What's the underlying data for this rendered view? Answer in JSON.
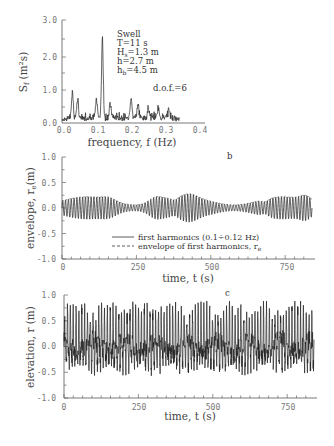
{
  "chart_data": [
    {
      "panel": "a",
      "type": "line",
      "title": "",
      "xlabel": "frequency, f (Hz)",
      "ylabel": "S_f (m^2 s)",
      "xlim": [
        0.0,
        0.4
      ],
      "ylim": [
        0.0,
        3.0
      ],
      "xticks": [
        "0.0",
        "0.1",
        "0.2",
        "0.3",
        "0.4"
      ],
      "yticks": [
        "0.0",
        "1.0",
        "2.0",
        "3.0"
      ],
      "grid": false,
      "annotation_lines": [
        "Swell",
        "T=11 s",
        "Hs=1.3 m",
        "h=2.7 m",
        "hb=4.5 m"
      ],
      "annotation_dof": "d.o.f.=6"
    },
    {
      "panel": "b",
      "type": "line",
      "title": "",
      "xlabel": "time, t (s)",
      "ylabel": "envelope, r_e(m)",
      "xlim": [
        0,
        800
      ],
      "ylim": [
        -1.0,
        1.0
      ],
      "xticks": [
        "0",
        "250",
        "500",
        "750"
      ],
      "yticks": [
        "1.0",
        "0.5",
        "0.0",
        "-0.5",
        "-1.0"
      ],
      "grid": false,
      "panel_label": "b",
      "legend": [
        {
          "style": "solid",
          "label": "first harmonics (0.1÷0.12 Hz)"
        },
        {
          "style": "dashed",
          "label": "envelope of first harmonics, r",
          "subscript": "e"
        }
      ],
      "legend_position": "lower center"
    },
    {
      "panel": "c",
      "type": "line",
      "title": "",
      "xlabel": "time, t (s)",
      "ylabel": "elevation, r (m)",
      "xlim": [
        0,
        800
      ],
      "ylim": [
        -1.0,
        1.0
      ],
      "xticks": [
        "0",
        "250",
        "500",
        "750"
      ],
      "yticks": [
        "1.0",
        "0.5",
        "0.0",
        "-0.5",
        "-1.0"
      ],
      "grid": false,
      "panel_label": "c"
    }
  ],
  "panels": {
    "a": {
      "yaxis_title_main": "S",
      "yaxis_title_sub": "f",
      "yaxis_title_units": "(m²s)",
      "xaxis_title": "frequency, f (Hz)",
      "ticks_y": [
        "3.0",
        "2.0",
        "1.0",
        "0.0"
      ],
      "ticks_x": [
        "0.0",
        "0.1",
        "0.2",
        "0.3",
        "0.4"
      ],
      "annot": {
        "line1": "Swell",
        "line2": "T=11 s",
        "line3_main": "H",
        "line3_sub": "s",
        "line3_rest": "=1.3 m",
        "line4": "h=2.7 m",
        "line5_main": "h",
        "line5_sub": "b",
        "line5_rest": "=4.5 m",
        "dof": "d.o.f.=6"
      }
    },
    "b": {
      "label": "b",
      "yaxis_title": "envelope, r",
      "yaxis_title_sub": "e",
      "yaxis_title_units": "(m)",
      "xaxis_title": "time, t (s)",
      "ticks_y": [
        "1.0",
        "0.5",
        "0.0",
        "-0.5",
        "-1.0"
      ],
      "ticks_x": [
        "0",
        "250",
        "500",
        "750"
      ],
      "legend_solid": "first harmonics (0.1÷0.12 Hz)",
      "legend_dashed": "envelope of first harmonics, r",
      "legend_dashed_sub": "e"
    },
    "c": {
      "label": "c",
      "yaxis_title": "elevation, r (m)",
      "xaxis_title": "time, t (s)",
      "ticks_y": [
        "1.0",
        "0.5",
        "0.0",
        "-0.5",
        "-1.0"
      ],
      "ticks_x": [
        "0",
        "250",
        "500",
        "750"
      ]
    }
  }
}
